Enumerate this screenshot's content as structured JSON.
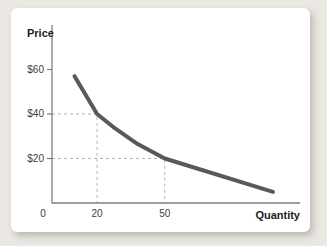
{
  "chart_data": {
    "type": "line",
    "title": "",
    "xlabel": "Quantity",
    "ylabel": "Price",
    "xlim": [
      0,
      110
    ],
    "ylim": [
      0,
      80
    ],
    "grid": false,
    "legend": "none",
    "series": [
      {
        "name": "demand-curve",
        "points": [
          [
            10,
            57
          ],
          [
            20,
            40
          ],
          [
            28,
            33.5
          ],
          [
            38,
            26.5
          ],
          [
            50,
            20
          ],
          [
            98,
            5
          ]
        ]
      }
    ],
    "annotated_points": [
      {
        "x": 20,
        "y": 40,
        "x_label": "20",
        "y_label": "$40"
      },
      {
        "x": 50,
        "y": 20,
        "x_label": "50",
        "y_label": "$20"
      }
    ],
    "yticks": [
      {
        "value": 60,
        "label": "$60"
      },
      {
        "value": 40,
        "label": "$40"
      },
      {
        "value": 20,
        "label": "$20"
      }
    ],
    "xticks": [
      {
        "value": 0,
        "label": "0"
      },
      {
        "value": 20,
        "label": "20"
      },
      {
        "value": 50,
        "label": "50"
      }
    ],
    "colors": {
      "curve": "#58595b",
      "axis": "#7f7f7f",
      "dashed_guide": "#b3b3b3",
      "tick_text": "#3d3d3d",
      "axis_label_text": "#1c1c1c",
      "card_background": "#ffffff",
      "page_background": "#ebe8e4"
    }
  }
}
